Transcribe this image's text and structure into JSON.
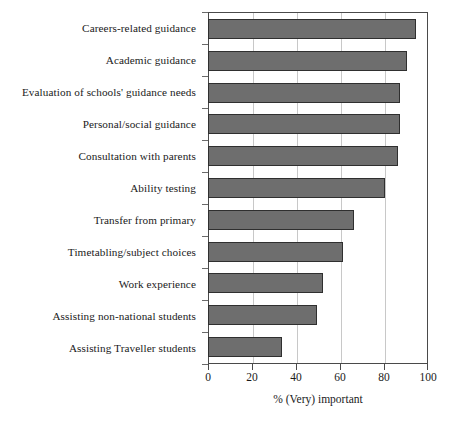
{
  "chart_data": {
    "type": "bar",
    "orientation": "horizontal",
    "title": "",
    "xlabel": "% (Very) important",
    "ylabel": "",
    "xlim": [
      0,
      100
    ],
    "xticks": [
      0,
      20,
      40,
      60,
      80,
      100
    ],
    "grid": "vertical",
    "legend": "none",
    "categories": [
      "Careers-related guidance",
      "Academic guidance",
      "Evaluation of schools' guidance needs",
      "Personal/social guidance",
      "Consultation with parents",
      "Ability testing",
      "Transfer from primary",
      "Timetabling/subject choices",
      "Work experience",
      "Assisting non-national students",
      "Assisting Traveller students"
    ],
    "values": [
      94,
      90,
      87,
      87,
      86,
      80,
      66,
      61,
      52,
      49,
      33
    ],
    "colors": {
      "bar_fill": "#6e6e6e",
      "bar_border": "#2f2f2f",
      "gridline": "#c8c8c8",
      "axis": "#4a4a4a",
      "background": "#ffffff",
      "text": "#1a1a1a"
    }
  }
}
